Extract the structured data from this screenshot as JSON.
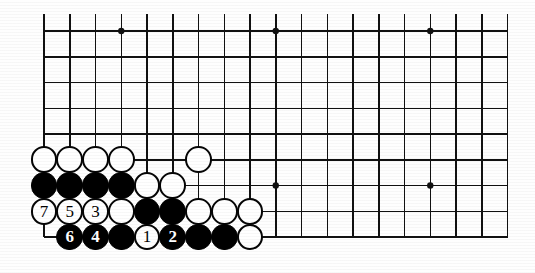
{
  "figure": {
    "kind": "go-board-diagram",
    "board_size": 19,
    "background_color": "#ffffff",
    "line_color": "#111111",
    "black_stone_color": "#000000",
    "white_stone_color": "#ffffff"
  },
  "grid": {
    "cols_visible": 19,
    "rows_visible": 9,
    "origin_x": 44,
    "origin_y": 31,
    "spacing": 25.75,
    "edge_line_width": 2.6,
    "inner_line_width": 1.5,
    "bottom_edge_is_board_edge": true,
    "left_edge_is_board_edge": true,
    "top_edge_is_board_edge": false,
    "right_edge_is_board_edge": false
  },
  "star_points": [
    {
      "col": 3,
      "row": 0,
      "label": "star-point-top-left"
    },
    {
      "col": 9,
      "row": 0,
      "label": "star-point-top-center"
    },
    {
      "col": 15,
      "row": 0,
      "label": "star-point-top-right"
    },
    {
      "col": 9,
      "row": 6,
      "label": "star-point-bottom-center"
    },
    {
      "col": 15,
      "row": 6,
      "label": "star-point-bottom-right"
    }
  ],
  "stones": [
    {
      "id": "w-r5-c0",
      "color": "white",
      "col": 0,
      "row": 5,
      "label": ""
    },
    {
      "id": "w-r5-c1",
      "color": "white",
      "col": 1,
      "row": 5,
      "label": ""
    },
    {
      "id": "w-r5-c2",
      "color": "white",
      "col": 2,
      "row": 5,
      "label": ""
    },
    {
      "id": "w-r5-c3",
      "color": "white",
      "col": 3,
      "row": 5,
      "label": ""
    },
    {
      "id": "w-r5-c6",
      "color": "white",
      "col": 6,
      "row": 5,
      "label": ""
    },
    {
      "id": "b-r6-c0",
      "color": "black",
      "col": 0,
      "row": 6,
      "label": ""
    },
    {
      "id": "b-r6-c1",
      "color": "black",
      "col": 1,
      "row": 6,
      "label": ""
    },
    {
      "id": "b-r6-c2",
      "color": "black",
      "col": 2,
      "row": 6,
      "label": ""
    },
    {
      "id": "b-r6-c3",
      "color": "black",
      "col": 3,
      "row": 6,
      "label": ""
    },
    {
      "id": "w-r6-c4",
      "color": "white",
      "col": 4,
      "row": 6,
      "label": ""
    },
    {
      "id": "w-r6-c5",
      "color": "white",
      "col": 5,
      "row": 6,
      "label": ""
    },
    {
      "id": "w-r7-c0",
      "color": "white",
      "col": 0,
      "row": 7,
      "label": "7"
    },
    {
      "id": "w-r7-c1",
      "color": "white",
      "col": 1,
      "row": 7,
      "label": "5"
    },
    {
      "id": "w-r7-c2",
      "color": "white",
      "col": 2,
      "row": 7,
      "label": "3"
    },
    {
      "id": "w-r7-c3",
      "color": "white",
      "col": 3,
      "row": 7,
      "label": ""
    },
    {
      "id": "b-r7-c4",
      "color": "black",
      "col": 4,
      "row": 7,
      "label": ""
    },
    {
      "id": "b-r7-c5",
      "color": "black",
      "col": 5,
      "row": 7,
      "label": ""
    },
    {
      "id": "w-r7-c6",
      "color": "white",
      "col": 6,
      "row": 7,
      "label": ""
    },
    {
      "id": "w-r7-c7",
      "color": "white",
      "col": 7,
      "row": 7,
      "label": ""
    },
    {
      "id": "w-r7-c8",
      "color": "white",
      "col": 8,
      "row": 7,
      "label": ""
    },
    {
      "id": "b-r8-c1",
      "color": "black",
      "col": 1,
      "row": 8,
      "label": "6"
    },
    {
      "id": "b-r8-c2",
      "color": "black",
      "col": 2,
      "row": 8,
      "label": "4"
    },
    {
      "id": "b-r8-c3",
      "color": "black",
      "col": 3,
      "row": 8,
      "label": ""
    },
    {
      "id": "w-r8-c4",
      "color": "white",
      "col": 4,
      "row": 8,
      "label": "1"
    },
    {
      "id": "b-r8-c5",
      "color": "black",
      "col": 5,
      "row": 8,
      "label": "2"
    },
    {
      "id": "b-r8-c6",
      "color": "black",
      "col": 6,
      "row": 8,
      "label": ""
    },
    {
      "id": "b-r8-c7",
      "color": "black",
      "col": 7,
      "row": 8,
      "label": ""
    },
    {
      "id": "w-r8-c8",
      "color": "white",
      "col": 8,
      "row": 8,
      "label": ""
    }
  ],
  "move_sequence": [
    {
      "number": "1",
      "color": "white",
      "col": 4,
      "row": 8
    },
    {
      "number": "2",
      "color": "black",
      "col": 5,
      "row": 8
    },
    {
      "number": "3",
      "color": "white",
      "col": 2,
      "row": 7
    },
    {
      "number": "4",
      "color": "black",
      "col": 2,
      "row": 8
    },
    {
      "number": "5",
      "color": "white",
      "col": 1,
      "row": 7
    },
    {
      "number": "6",
      "color": "black",
      "col": 1,
      "row": 8
    },
    {
      "number": "7",
      "color": "white",
      "col": 0,
      "row": 7
    }
  ]
}
